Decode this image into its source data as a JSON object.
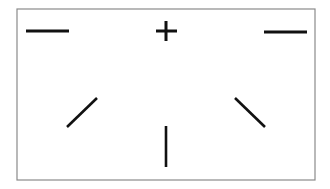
{
  "diagram": {
    "background": "#ffffff",
    "frame": {
      "x": 17,
      "y": 9,
      "width": 298,
      "height": 171,
      "stroke": "#8a8a8a",
      "stroke_width": 1.2
    },
    "stroke_color": "#111111",
    "fixation_cross": {
      "icon": "plus-icon",
      "horizontal": {
        "x1": 156,
        "y1": 31,
        "x2": 177,
        "y2": 31
      },
      "vertical": {
        "x1": 166,
        "y1": 21,
        "x2": 166,
        "y2": 41
      },
      "stroke_width": 3
    },
    "targets": [
      {
        "name": "top-left-horizontal",
        "x1": 26,
        "y1": 31,
        "x2": 69,
        "y2": 31,
        "stroke_width": 2.8
      },
      {
        "name": "top-right-horizontal",
        "x1": 264,
        "y1": 32,
        "x2": 307,
        "y2": 32,
        "stroke_width": 2.8
      },
      {
        "name": "left-diagonal",
        "x1": 67,
        "y1": 127,
        "x2": 97,
        "y2": 98,
        "stroke_width": 2.6
      },
      {
        "name": "right-diagonal",
        "x1": 235,
        "y1": 98,
        "x2": 265,
        "y2": 127,
        "stroke_width": 2.6
      },
      {
        "name": "bottom-vertical",
        "x1": 166,
        "y1": 126,
        "x2": 166,
        "y2": 167,
        "stroke_width": 2.6
      }
    ]
  }
}
